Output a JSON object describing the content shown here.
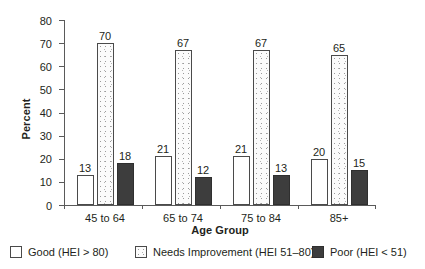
{
  "chart_data": {
    "type": "bar",
    "title": "",
    "xlabel": "Age Group",
    "ylabel": "Percent",
    "categories": [
      "45 to 64",
      "65 to 74",
      "75 to 84",
      "85+"
    ],
    "series": [
      {
        "name": "Good (HEI > 80)",
        "values": [
          13,
          21,
          21,
          20
        ],
        "fill": "white",
        "color": "#ffffff"
      },
      {
        "name": "Needs Improvement (HEI 51–80)",
        "values": [
          70,
          67,
          67,
          65
        ],
        "fill": "stipple",
        "color": "#fbfbfb"
      },
      {
        "name": "Poor (HEI < 51)",
        "values": [
          18,
          12,
          13,
          15
        ],
        "fill": "solid",
        "color": "#3d3d3d"
      }
    ],
    "ylim": [
      0,
      80
    ],
    "yticks": [
      0,
      10,
      20,
      30,
      40,
      50,
      60,
      70,
      80
    ],
    "ytick_labels": [
      "0",
      "10",
      "20",
      "30",
      "40",
      "50",
      "60",
      "70",
      "80"
    ],
    "grid": false,
    "legend_position": "bottom",
    "data_labels": true
  },
  "axes": {
    "y_title": "Percent",
    "x_title": "Age Group"
  },
  "legend": {
    "items": [
      {
        "label": "Good (HEI > 80)",
        "swatch": "good"
      },
      {
        "label": "Needs Improvement (HEI 51–80)",
        "swatch": "needs"
      },
      {
        "label": "Poor (HEI < 51)",
        "swatch": "poor"
      }
    ]
  }
}
